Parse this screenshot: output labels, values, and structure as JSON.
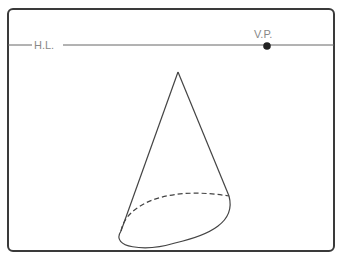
{
  "diagram": {
    "horizon_label": "H.L.",
    "vanishing_point_label": "V.P.",
    "colors": {
      "frame": "#3a3a3a",
      "line": "#555555",
      "label": "#888888",
      "point": "#222222"
    }
  }
}
